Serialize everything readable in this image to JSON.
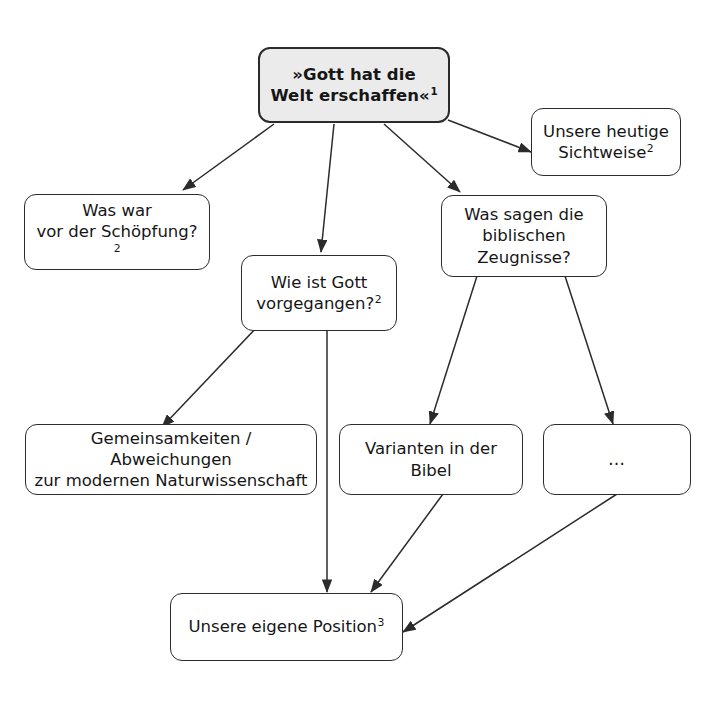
{
  "diagram": {
    "title_node": {
      "id": "gott-hat-die-welt-erschaffen",
      "text": "»Gott hat die Welt erschaffen«",
      "superscript": "1"
    },
    "nodes": [
      {
        "id": "unsere-heutige-sichtweise",
        "line1": "Unsere heutige",
        "line2": "Sichtweise",
        "superscript": "2"
      },
      {
        "id": "was-war-vor-der-schoepfung",
        "line1": "Was war",
        "line2": "vor der Schöpfung?",
        "superscript": "2"
      },
      {
        "id": "wie-ist-gott-vorgegangen",
        "line1": "Wie ist Gott",
        "line2": "vorgegangen?",
        "superscript": "2"
      },
      {
        "id": "was-sagen-die-biblischen-zeugnisse",
        "line1": "Was sagen die",
        "line2": "biblischen",
        "line3": "Zeugnisse?",
        "superscript": ""
      },
      {
        "id": "gemeinsamkeiten-abweichungen",
        "line1": "Gemeinsamkeiten / Abweichungen",
        "line2": "zur modernen Naturwissenschaft",
        "superscript": ""
      },
      {
        "id": "varianten-in-der-bibel",
        "line1": "Varianten in der Bibel",
        "superscript": ""
      },
      {
        "id": "weitere-punkte",
        "line1": "…",
        "superscript": ""
      },
      {
        "id": "unsere-eigene-position",
        "line1": "Unsere eigene Position",
        "superscript": "3"
      }
    ],
    "colors": {
      "root_fill": "#ebebeb",
      "node_fill": "#ffffff",
      "border": "#2b2b2b",
      "text": "#161616",
      "edge": "#2b2b2b",
      "background": "#ffffff"
    }
  }
}
